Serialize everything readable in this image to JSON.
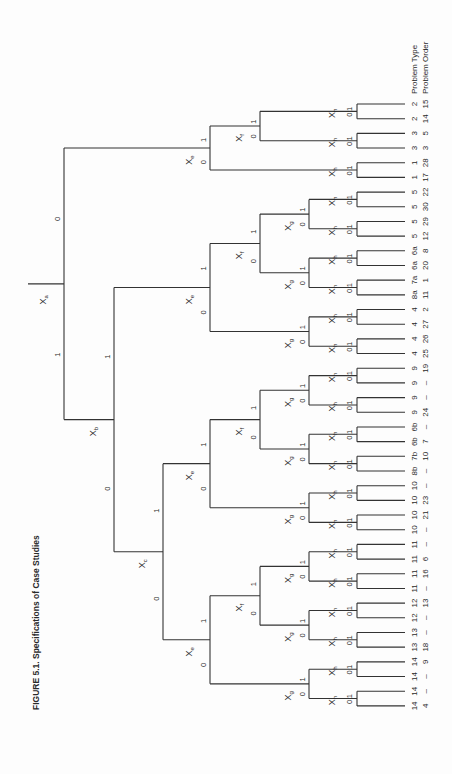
{
  "caption": "FIGURE 5.1. Specifications of Case Studies",
  "column_headers": {
    "problem_type": "Problem Type",
    "problem_order": "Problem Order"
  },
  "colors": {
    "line": "#333333",
    "text": "#2a2a2a",
    "background": "#fdfdfd"
  },
  "layout": {
    "leaf_y0": 104,
    "leaf_dy": 14.68,
    "leaf_x1": 357,
    "leaf_x2": 405,
    "depth_x": {
      "root": 28,
      "Xa": 64,
      "Xb": 114,
      "Xc": 163,
      "Xe": 210,
      "Xf": 260,
      "Xg": 309,
      "Xh": 357
    }
  },
  "leaves": [
    {
      "type": "2",
      "order": "15"
    },
    {
      "type": "2",
      "order": "14"
    },
    {
      "type": "3",
      "order": "5"
    },
    {
      "type": "3",
      "order": "3"
    },
    {
      "type": "1",
      "order": "28"
    },
    {
      "type": "1",
      "order": "17"
    },
    {
      "type": "5",
      "order": "22"
    },
    {
      "type": "5",
      "order": "30"
    },
    {
      "type": "5",
      "order": "29"
    },
    {
      "type": "5",
      "order": "12"
    },
    {
      "type": "6a",
      "order": "8"
    },
    {
      "type": "6a",
      "order": "20"
    },
    {
      "type": "7a",
      "order": "1"
    },
    {
      "type": "8a",
      "order": "11"
    },
    {
      "type": "4",
      "order": "2"
    },
    {
      "type": "4",
      "order": "27"
    },
    {
      "type": "4",
      "order": "26"
    },
    {
      "type": "4",
      "order": "25"
    },
    {
      "type": "9",
      "order": "19"
    },
    {
      "type": "9",
      "order": "–"
    },
    {
      "type": "9",
      "order": "–"
    },
    {
      "type": "9",
      "order": "24"
    },
    {
      "type": "6b",
      "order": "–"
    },
    {
      "type": "6b",
      "order": "7"
    },
    {
      "type": "7b",
      "order": "10"
    },
    {
      "type": "8b",
      "order": "–"
    },
    {
      "type": "10",
      "order": "–"
    },
    {
      "type": "10",
      "order": "23"
    },
    {
      "type": "10",
      "order": "21"
    },
    {
      "type": "10",
      "order": "–"
    },
    {
      "type": "11",
      "order": "–"
    },
    {
      "type": "11",
      "order": "6"
    },
    {
      "type": "11",
      "order": "16"
    },
    {
      "type": "11",
      "order": "–"
    },
    {
      "type": "12",
      "order": "13"
    },
    {
      "type": "12",
      "order": "–"
    },
    {
      "type": "13",
      "order": "–"
    },
    {
      "type": "13",
      "order": "18"
    },
    {
      "type": "14",
      "order": "9"
    },
    {
      "type": "14",
      "order": "–"
    },
    {
      "type": "14",
      "order": "–"
    },
    {
      "type": "14",
      "order": "4"
    }
  ],
  "tree": {
    "var": "Xa",
    "sub": "a",
    "children": [
      {
        "bit": "0",
        "node": {
          "var": "Xe",
          "sub": "e",
          "children": [
            {
              "bit": "1",
              "node": {
                "var": "Xf",
                "sub": "f",
                "children": [
                  {
                    "bit": "1",
                    "node": {
                      "var": "Xh",
                      "sub": "h",
                      "leaves": [
                        0,
                        1
                      ]
                    }
                  },
                  {
                    "bit": "0",
                    "node": {
                      "var": "Xh",
                      "sub": "h",
                      "leaves": [
                        2,
                        3
                      ]
                    }
                  }
                ]
              }
            },
            {
              "bit": "0",
              "node": {
                "var": "Xh",
                "sub": "h",
                "leaves": [
                  4,
                  5
                ]
              }
            }
          ]
        }
      },
      {
        "bit": "1",
        "node": {
          "var": "Xb",
          "sub": "b",
          "children": [
            {
              "bit": "1",
              "node": {
                "var": "Xe",
                "sub": "e",
                "children": [
                  {
                    "bit": "1",
                    "node": {
                      "var": "Xf",
                      "sub": "f",
                      "children": [
                        {
                          "bit": "1",
                          "node": {
                            "var": "Xg",
                            "sub": "g",
                            "children": [
                              {
                                "bit": "1",
                                "node": {
                                  "var": "Xh",
                                  "sub": "h",
                                  "leaves": [
                                    6,
                                    7
                                  ]
                                }
                              },
                              {
                                "bit": "0",
                                "node": {
                                  "var": "Xh",
                                  "sub": "h",
                                  "leaves": [
                                    8,
                                    9
                                  ]
                                }
                              }
                            ]
                          }
                        },
                        {
                          "bit": "0",
                          "node": {
                            "var": "Xg",
                            "sub": "g",
                            "children": [
                              {
                                "bit": "1",
                                "node": {
                                  "var": "Xh",
                                  "sub": "h",
                                  "leaves": [
                                    10,
                                    11
                                  ]
                                }
                              },
                              {
                                "bit": "0",
                                "node": {
                                  "var": "Xh",
                                  "sub": "h",
                                  "leaves": [
                                    12,
                                    13
                                  ]
                                }
                              }
                            ]
                          }
                        }
                      ]
                    }
                  },
                  {
                    "bit": "0",
                    "node": {
                      "var": "Xg",
                      "sub": "g",
                      "children": [
                        {
                          "bit": "1",
                          "node": {
                            "var": "Xh",
                            "sub": "h",
                            "leaves": [
                              14,
                              15
                            ]
                          }
                        },
                        {
                          "bit": "0",
                          "node": {
                            "var": "Xh",
                            "sub": "h",
                            "leaves": [
                              16,
                              17
                            ]
                          }
                        }
                      ]
                    }
                  }
                ]
              }
            },
            {
              "bit": "0",
              "node": {
                "var": "Xc",
                "sub": "c",
                "children": [
                  {
                    "bit": "1",
                    "node": {
                      "var": "Xe",
                      "sub": "e",
                      "children": [
                        {
                          "bit": "1",
                          "node": {
                            "var": "Xf",
                            "sub": "f",
                            "children": [
                              {
                                "bit": "1",
                                "node": {
                                  "var": "Xg",
                                  "sub": "g",
                                  "children": [
                                    {
                                      "bit": "1",
                                      "node": {
                                        "var": "Xh",
                                        "sub": "h",
                                        "leaves": [
                                          18,
                                          19
                                        ]
                                      }
                                    },
                                    {
                                      "bit": "0",
                                      "node": {
                                        "var": "Xh",
                                        "sub": "h",
                                        "leaves": [
                                          20,
                                          21
                                        ]
                                      }
                                    }
                                  ]
                                }
                              },
                              {
                                "bit": "0",
                                "node": {
                                  "var": "Xg",
                                  "sub": "g",
                                  "children": [
                                    {
                                      "bit": "1",
                                      "node": {
                                        "var": "Xh",
                                        "sub": "h",
                                        "leaves": [
                                          22,
                                          23
                                        ]
                                      }
                                    },
                                    {
                                      "bit": "0",
                                      "node": {
                                        "var": "Xh",
                                        "sub": "h",
                                        "leaves": [
                                          24,
                                          25
                                        ]
                                      }
                                    }
                                  ]
                                }
                              }
                            ]
                          }
                        },
                        {
                          "bit": "0",
                          "node": {
                            "var": "Xg",
                            "sub": "g",
                            "children": [
                              {
                                "bit": "1",
                                "node": {
                                  "var": "Xh",
                                  "sub": "h",
                                  "leaves": [
                                    26,
                                    27
                                  ]
                                }
                              },
                              {
                                "bit": "0",
                                "node": {
                                  "var": "Xh",
                                  "sub": "h",
                                  "leaves": [
                                    28,
                                    29
                                  ]
                                }
                              }
                            ]
                          }
                        }
                      ]
                    }
                  },
                  {
                    "bit": "0",
                    "node": {
                      "var": "Xe",
                      "sub": "e",
                      "children": [
                        {
                          "bit": "1",
                          "node": {
                            "var": "Xf",
                            "sub": "f",
                            "children": [
                              {
                                "bit": "1",
                                "node": {
                                  "var": "Xg",
                                  "sub": "g",
                                  "children": [
                                    {
                                      "bit": "1",
                                      "node": {
                                        "var": "Xh",
                                        "sub": "h",
                                        "leaves": [
                                          30,
                                          31
                                        ]
                                      }
                                    },
                                    {
                                      "bit": "0",
                                      "node": {
                                        "var": "Xh",
                                        "sub": "h",
                                        "leaves": [
                                          32,
                                          33
                                        ]
                                      }
                                    }
                                  ]
                                }
                              },
                              {
                                "bit": "0",
                                "node": {
                                  "var": "Xg",
                                  "sub": "g",
                                  "children": [
                                    {
                                      "bit": "1",
                                      "node": {
                                        "var": "Xh",
                                        "sub": "h",
                                        "leaves": [
                                          34,
                                          35
                                        ]
                                      }
                                    },
                                    {
                                      "bit": "0",
                                      "node": {
                                        "var": "Xh",
                                        "sub": "h",
                                        "leaves": [
                                          36,
                                          37
                                        ]
                                      }
                                    }
                                  ]
                                }
                              }
                            ]
                          }
                        },
                        {
                          "bit": "0",
                          "node": {
                            "var": "Xg",
                            "sub": "g",
                            "children": [
                              {
                                "bit": "1",
                                "node": {
                                  "var": "Xh",
                                  "sub": "h",
                                  "leaves": [
                                    38,
                                    39
                                  ]
                                }
                              },
                              {
                                "bit": "0",
                                "node": {
                                  "var": "Xh",
                                  "sub": "h",
                                  "leaves": [
                                    40,
                                    41
                                  ]
                                }
                              }
                            ]
                          }
                        }
                      ]
                    }
                  }
                ]
              }
            }
          ]
        }
      }
    ]
  }
}
